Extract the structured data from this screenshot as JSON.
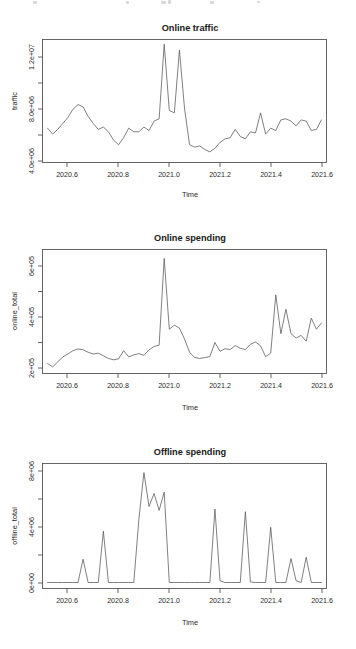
{
  "figure": {
    "background_color": "#ffffff",
    "line_color": "#555555",
    "axis_color": "#4a4a4a",
    "text_color": "#1a1a1a",
    "panel_count": 3
  },
  "chart_data": [
    {
      "type": "line",
      "title": "Online traffic",
      "xlabel": "Time",
      "ylabel": "traffic",
      "xlim": [
        2020.5,
        2021.62
      ],
      "ylim": [
        3600000,
        14000000
      ],
      "grid": false,
      "legend": null,
      "xticks": [
        2020.6,
        2020.8,
        2021.0,
        2021.2,
        2021.4,
        2021.6
      ],
      "xtick_labels": [
        "2020.6",
        "2020.8",
        "2021.0",
        "2021.2",
        "2021.4",
        "2021.6"
      ],
      "yticks": [
        4000000,
        8000000,
        12000000
      ],
      "ytick_labels": [
        "4.0e+06",
        "8.0e+06",
        "1.2e+07"
      ],
      "yminor_ticks": [
        6000000,
        10000000
      ],
      "x": [
        2020.52,
        2020.54,
        2020.56,
        2020.58,
        2020.6,
        2020.62,
        2020.64,
        2020.66,
        2020.68,
        2020.7,
        2020.72,
        2020.74,
        2020.76,
        2020.78,
        2020.8,
        2020.82,
        2020.84,
        2020.86,
        2020.88,
        2020.9,
        2020.92,
        2020.94,
        2020.96,
        2020.98,
        2021.0,
        2021.02,
        2021.04,
        2021.06,
        2021.08,
        2021.1,
        2021.12,
        2021.14,
        2021.16,
        2021.18,
        2021.2,
        2021.22,
        2021.24,
        2021.26,
        2021.28,
        2021.3,
        2021.32,
        2021.34,
        2021.36,
        2021.38,
        2021.4,
        2021.42,
        2021.44,
        2021.46,
        2021.48,
        2021.5,
        2021.52,
        2021.54,
        2021.56,
        2021.58,
        2021.6
      ],
      "values": [
        6500000,
        6000000,
        6400000,
        6900000,
        7400000,
        8100000,
        8500000,
        8300000,
        7500000,
        6900000,
        6400000,
        6600000,
        6200000,
        5500000,
        5100000,
        5700000,
        6500000,
        6200000,
        6200000,
        6600000,
        6300000,
        7100000,
        7300000,
        13600000,
        8000000,
        7800000,
        13100000,
        8200000,
        5100000,
        4900000,
        5000000,
        4700000,
        4500000,
        4800000,
        5300000,
        5600000,
        5700000,
        6400000,
        5800000,
        5600000,
        6200000,
        6100000,
        7800000,
        6000000,
        6500000,
        6300000,
        7200000,
        7300000,
        7100000,
        6700000,
        7200000,
        7100000,
        6300000,
        6400000,
        7200000
      ]
    },
    {
      "type": "line",
      "title": "Online spending",
      "xlabel": "Time",
      "ylabel": "online_total",
      "xlim": [
        2020.5,
        2021.62
      ],
      "ylim": [
        140000,
        700000
      ],
      "grid": false,
      "legend": null,
      "xticks": [
        2020.6,
        2020.8,
        2021.0,
        2021.2,
        2021.4,
        2021.6
      ],
      "xtick_labels": [
        "2020.6",
        "2020.8",
        "2021.0",
        "2021.2",
        "2021.4",
        "2021.6"
      ],
      "yticks": [
        200000,
        400000,
        600000
      ],
      "ytick_labels": [
        "2e+05",
        "4e+05",
        "6e+05"
      ],
      "yminor_ticks": [
        300000,
        500000
      ],
      "x": [
        2020.52,
        2020.54,
        2020.56,
        2020.58,
        2020.6,
        2020.62,
        2020.64,
        2020.66,
        2020.68,
        2020.7,
        2020.72,
        2020.74,
        2020.76,
        2020.78,
        2020.8,
        2020.82,
        2020.84,
        2020.86,
        2020.88,
        2020.9,
        2020.92,
        2020.94,
        2020.96,
        2020.98,
        2021.0,
        2021.02,
        2021.04,
        2021.06,
        2021.08,
        2021.1,
        2021.12,
        2021.14,
        2021.16,
        2021.18,
        2021.2,
        2021.22,
        2021.24,
        2021.26,
        2021.28,
        2021.3,
        2021.32,
        2021.34,
        2021.36,
        2021.38,
        2021.4,
        2021.42,
        2021.44,
        2021.46,
        2021.48,
        2021.5,
        2021.52,
        2021.54,
        2021.56,
        2021.58,
        2021.6
      ],
      "values": [
        185000,
        170000,
        192000,
        215000,
        228000,
        243000,
        251000,
        247000,
        236000,
        228000,
        232000,
        220000,
        208000,
        202000,
        206000,
        243000,
        215000,
        224000,
        230000,
        222000,
        247000,
        262000,
        268000,
        660000,
        340000,
        358000,
        345000,
        296000,
        236000,
        212000,
        208000,
        212000,
        216000,
        280000,
        240000,
        252000,
        248000,
        266000,
        254000,
        248000,
        272000,
        282000,
        265000,
        216000,
        232000,
        495000,
        320000,
        430000,
        320000,
        300000,
        312000,
        286000,
        390000,
        340000,
        368000
      ]
    },
    {
      "type": "line",
      "title": "Offline spending",
      "xlabel": "Time",
      "ylabel": "offline_total",
      "xlim": [
        2020.5,
        2021.62
      ],
      "ylim": [
        -400000,
        9200000
      ],
      "grid": false,
      "legend": null,
      "xticks": [
        2020.6,
        2020.8,
        2021.0,
        2021.2,
        2021.4,
        2021.6
      ],
      "xtick_labels": [
        "2020.6",
        "2020.8",
        "2021.0",
        "2021.2",
        "2021.4",
        "2021.6"
      ],
      "yticks": [
        0,
        4000000,
        8000000
      ],
      "ytick_labels": [
        "0e+00",
        "4e+06",
        "8e+06"
      ],
      "yminor_ticks": [
        2000000,
        6000000
      ],
      "x": [
        2020.52,
        2020.54,
        2020.56,
        2020.58,
        2020.6,
        2020.62,
        2020.64,
        2020.66,
        2020.68,
        2020.7,
        2020.72,
        2020.74,
        2020.76,
        2020.78,
        2020.8,
        2020.82,
        2020.84,
        2020.86,
        2020.88,
        2020.9,
        2020.92,
        2020.94,
        2020.96,
        2020.98,
        2021.0,
        2021.02,
        2021.04,
        2021.06,
        2021.08,
        2021.1,
        2021.12,
        2021.14,
        2021.16,
        2021.18,
        2021.2,
        2021.22,
        2021.24,
        2021.26,
        2021.28,
        2021.3,
        2021.32,
        2021.34,
        2021.36,
        2021.38,
        2021.4,
        2021.42,
        2021.44,
        2021.46,
        2021.48,
        2021.5,
        2021.52,
        2021.54,
        2021.56,
        2021.58,
        2021.6
      ],
      "values": [
        60000,
        60000,
        60000,
        60000,
        60000,
        60000,
        60000,
        1850000,
        60000,
        60000,
        60000,
        4000000,
        60000,
        60000,
        60000,
        60000,
        60000,
        60000,
        4900000,
        8500000,
        5900000,
        6900000,
        5600000,
        7000000,
        60000,
        60000,
        60000,
        60000,
        60000,
        60000,
        60000,
        60000,
        60000,
        5700000,
        200000,
        60000,
        60000,
        60000,
        60000,
        5500000,
        100000,
        60000,
        60000,
        60000,
        4300000,
        60000,
        60000,
        60000,
        1900000,
        200000,
        60000,
        2000000,
        60000,
        60000,
        60000
      ]
    }
  ]
}
